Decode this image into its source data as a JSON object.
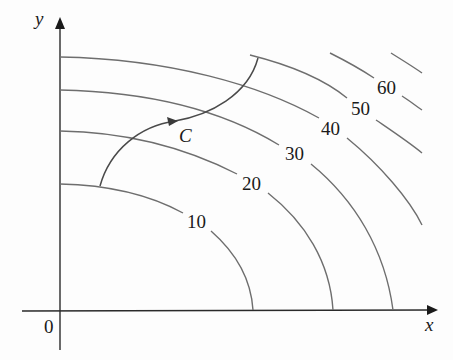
{
  "figure": {
    "axes": {
      "x_label": "x",
      "y_label": "y",
      "origin_label": "0"
    },
    "curve": {
      "label": "C",
      "description": "oriented path crossing level curves from 10 to 50"
    },
    "contour_labels": [
      "10",
      "20",
      "30",
      "40",
      "50",
      "60"
    ],
    "colors": {
      "contour": "#6e6e6e",
      "axis": "#2a2a2a",
      "curve": "#4a4a4a",
      "text": "#1a1a1a"
    }
  }
}
